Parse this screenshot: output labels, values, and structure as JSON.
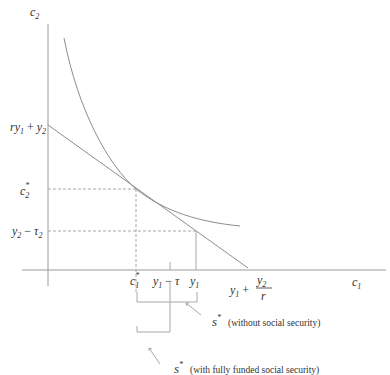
{
  "diagram": {
    "type": "intertemporal consumption diagram",
    "axes": {
      "y_label": "c",
      "y_sub": "2",
      "x_label": "c",
      "x_sub": "1"
    },
    "y_ticks": {
      "intercept": {
        "a": "ry",
        "a_sub": "1",
        "plus": " + ",
        "b": "y",
        "b_sub": "2"
      },
      "c2_star": {
        "base": "c",
        "sub": "2",
        "sup": "*"
      },
      "y2_minus_tau2": {
        "a": "y",
        "a_sub": "2",
        "minus": " − ",
        "b": "τ",
        "b_sub": "2"
      }
    },
    "x_ticks": {
      "c1_star": {
        "base": "c",
        "sub": "1",
        "sup": "*"
      },
      "y1_minus_tau": {
        "a": "y",
        "a_sub": "1",
        "minus": " − ",
        "b": "τ"
      },
      "y1": {
        "a": "y",
        "a_sub": "1"
      },
      "intercept": {
        "a": "y",
        "a_sub": "1",
        "plus": " + ",
        "num": "y",
        "num_sub": "2",
        "den": "r"
      }
    },
    "annotations": [
      {
        "sym": "s",
        "sup": "*",
        "text": "(without social security)"
      },
      {
        "sym": "s",
        "sup": "*",
        "text": "(with fully funded social security)"
      }
    ]
  }
}
